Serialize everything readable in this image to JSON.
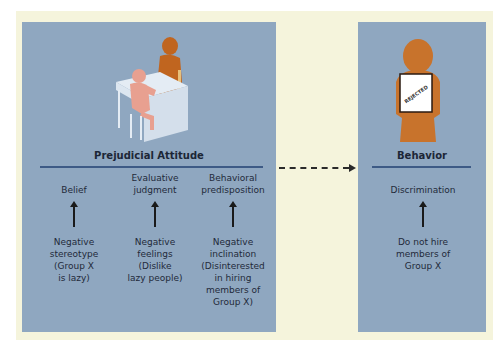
{
  "colors": {
    "background_cream": "#f5f4dc",
    "panel_blue": "#8fa7c0",
    "rule_blue": "#3d5a85",
    "figure_orange": "#c0651f",
    "figure_pink": "#e8a090",
    "desk_light": "#dce6f0"
  },
  "attitude_panel": {
    "title": "Prejudicial Attitude",
    "illustration": "interview-scene",
    "columns": [
      {
        "heading": "Belief",
        "detail": "Negative\nstereotype\n(Group X\nis lazy)"
      },
      {
        "heading": "Evaluative\njudgment",
        "detail": "Negative\nfeelings\n(Dislike\nlazy people)"
      },
      {
        "heading": "Behavioral\npredisposition",
        "detail": "Negative\ninclination\n(Disinterested\nin hiring\nmembers of\nGroup X)"
      }
    ]
  },
  "connector": {
    "style": "dashed-arrow"
  },
  "behavior_panel": {
    "title": "Behavior",
    "illustration": "person-holding-rejected-sign",
    "sign_text": "REJECTED",
    "columns": [
      {
        "heading": "Discrimination",
        "detail": "Do not hire\nmembers of\nGroup X"
      }
    ]
  }
}
